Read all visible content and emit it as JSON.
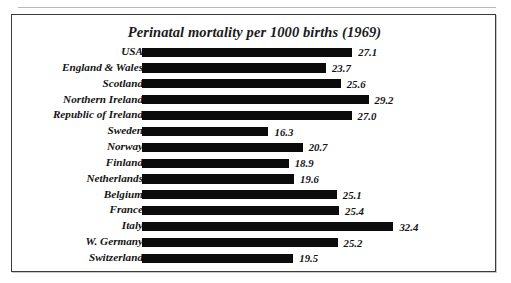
{
  "page": {
    "top_sliver_text": "",
    "background_color": "#ffffff",
    "frame_color": "#3b3b3b"
  },
  "figure": {
    "title": "Perinatal mortality per 1000 births (1969)",
    "bar_color": "#0b0b0b",
    "text_color": "#131313"
  },
  "chart_data": {
    "type": "bar",
    "orientation": "horizontal",
    "title": "Perinatal mortality per 1000 births (1969)",
    "xlabel": "",
    "ylabel": "",
    "xlim": [
      0,
      32.4
    ],
    "grid": false,
    "legend": null,
    "value_labels": true,
    "categories": [
      "USA",
      "England & Wales",
      "Scotland",
      "Northern Ireland",
      "Republic of Ireland",
      "Sweden",
      "Norway",
      "Finland",
      "Netherlands",
      "Belgium",
      "France",
      "Italy",
      "W. Germany",
      "Switzerland"
    ],
    "values": [
      27.1,
      23.7,
      25.6,
      29.2,
      27.0,
      16.3,
      20.7,
      18.9,
      19.6,
      25.1,
      25.4,
      32.4,
      25.2,
      19.5
    ],
    "value_texts": [
      "27.1",
      "23.7",
      "25.6",
      "29.2",
      "27.0",
      "16.3",
      "20.7",
      "18.9",
      "19.6",
      "25.1",
      "25.4",
      "32.4",
      "25.2",
      "19.5"
    ],
    "rows": [
      {
        "label": "USA",
        "value": 27.1,
        "value_text": "27.1"
      },
      {
        "label": "England & Wales",
        "value": 23.7,
        "value_text": "23.7"
      },
      {
        "label": "Scotland",
        "value": 25.6,
        "value_text": "25.6"
      },
      {
        "label": "Northern Ireland",
        "value": 29.2,
        "value_text": "29.2"
      },
      {
        "label": "Republic of Ireland",
        "value": 27.0,
        "value_text": "27.0"
      },
      {
        "label": "Sweden",
        "value": 16.3,
        "value_text": "16.3"
      },
      {
        "label": "Norway",
        "value": 20.7,
        "value_text": "20.7"
      },
      {
        "label": "Finland",
        "value": 18.9,
        "value_text": "18.9"
      },
      {
        "label": "Netherlands",
        "value": 19.6,
        "value_text": "19.6"
      },
      {
        "label": "Belgium",
        "value": 25.1,
        "value_text": "25.1"
      },
      {
        "label": "France",
        "value": 25.4,
        "value_text": "25.4"
      },
      {
        "label": "Italy",
        "value": 32.4,
        "value_text": "32.4"
      },
      {
        "label": "W. Germany",
        "value": 25.2,
        "value_text": "25.2"
      },
      {
        "label": "Switzerland",
        "value": 19.5,
        "value_text": "19.5"
      }
    ],
    "scale": {
      "px_per_unit": 7.76,
      "max_bar_px": 251
    }
  }
}
